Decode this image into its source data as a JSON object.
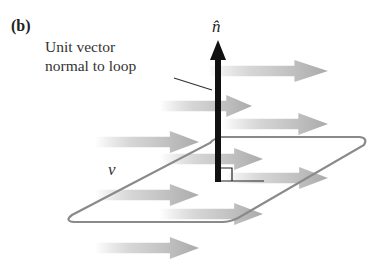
{
  "figure": {
    "panel_label": "(b)",
    "caption_line1": "Unit vector",
    "caption_line2": "normal to loop",
    "normal_label": "n̂",
    "velocity_label": "v⃗"
  },
  "colors": {
    "normal_arrow": "#111111",
    "flow_arrow": "#b8b8b8",
    "loop_outline": "#8a8a8a",
    "background": "#ffffff"
  }
}
